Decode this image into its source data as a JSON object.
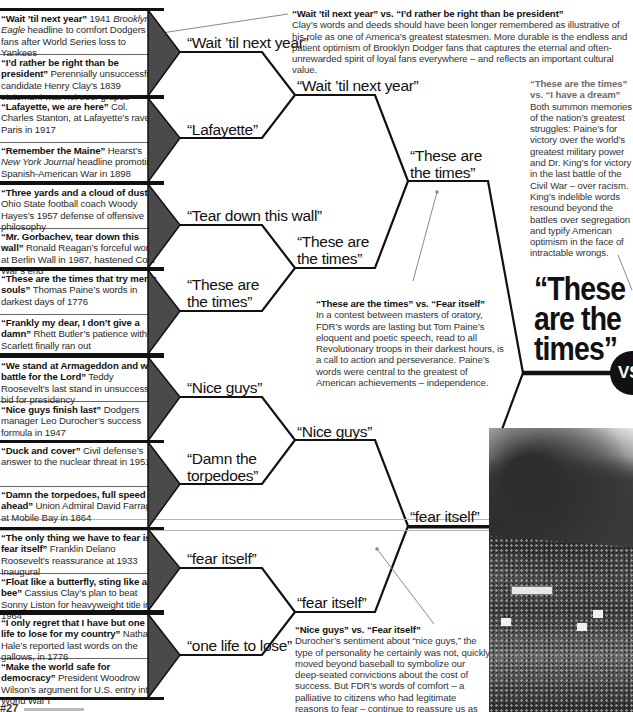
{
  "entries": [
    {
      "pair": [
        {
          "quote": "“Wait ’til next year”",
          "desc_pre": " 1941 ",
          "desc_italic": "Brooklyn Eagle",
          "desc_post": " headline to comfort Dodgers fans after World Series loss to Yankees"
        },
        {
          "quote": "“I’d rather be right than be president”",
          "desc_pre": " Perennially unsuccessful candidate Henry Clay’s 1839 statement was not sour grapes",
          "desc_italic": "",
          "desc_post": ""
        }
      ],
      "winner": "“Wait ’til next year”"
    },
    {
      "pair": [
        {
          "quote": "“Lafayette, we are here”",
          "desc_pre": " Col. Charles Stanton, at Lafayette’s rave in Paris in 1917",
          "desc_italic": "",
          "desc_post": ""
        },
        {
          "quote": "“Remember the Maine”",
          "desc_pre": " Hearst’s ",
          "desc_italic": "New York Journal",
          "desc_post": " headline promoting Spanish-American War in 1898"
        }
      ],
      "winner": "“Lafayette”"
    },
    {
      "pair": [
        {
          "quote": "“Three yards and a cloud of dust”",
          "desc_pre": " Ohio State football coach Woody Hayes’s 1957 defense of offensive philosophy",
          "desc_italic": "",
          "desc_post": ""
        },
        {
          "quote": "“Mr. Gorbachev, tear down this wall”",
          "desc_pre": " Ronald Reagan’s forceful words at Berlin Wall in 1987, hastened Cold War’s end",
          "desc_italic": "",
          "desc_post": ""
        }
      ],
      "winner": "“Tear down this wall”"
    },
    {
      "pair": [
        {
          "quote": "“These are the times that try men’s souls”",
          "desc_pre": " Thomas Paine’s words in darkest days of 1776",
          "desc_italic": "",
          "desc_post": ""
        },
        {
          "quote": "“Frankly my dear, I don’t give a damn”",
          "desc_pre": " Rhett Butler’s patience with Scarlett finally ran out",
          "desc_italic": "",
          "desc_post": ""
        }
      ],
      "winner": "“These are the times”"
    },
    {
      "pair": [
        {
          "quote": "“We stand at Armageddon and we battle for the Lord”",
          "desc_pre": " Teddy Roosevelt’s last stand in unsuccessful bid for presidency",
          "desc_italic": "",
          "desc_post": ""
        },
        {
          "quote": "“Nice guys finish last”",
          "desc_pre": " Dodgers manager Leo Durocher’s success formula in 1947",
          "desc_italic": "",
          "desc_post": ""
        }
      ],
      "winner": "“Nice guys”"
    },
    {
      "pair": [
        {
          "quote": "“Duck and cover”",
          "desc_pre": " Civil defense’s answer to the nuclear threat in 1951",
          "desc_italic": "",
          "desc_post": ""
        },
        {
          "quote": "“Damn the torpedoes, full speed ahead”",
          "desc_pre": " Union Admiral David Farragut at Mobile Bay in 1864",
          "desc_italic": "",
          "desc_post": ""
        }
      ],
      "winner": "“Damn the torpedoes”"
    },
    {
      "pair": [
        {
          "quote": "“The only thing we have to fear is fear itself”",
          "desc_pre": " Franklin Delano Roosevelt’s reassurance at 1933 Inaugural",
          "desc_italic": "",
          "desc_post": ""
        },
        {
          "quote": "“Float like a butterfly, sting like a bee”",
          "desc_pre": " Cassius Clay’s plan to beat Sonny Liston for heavyweight title in 1964",
          "desc_italic": "",
          "desc_post": ""
        }
      ],
      "winner": "“fear itself”"
    },
    {
      "pair": [
        {
          "quote": "“I only regret that I have but one life to lose for my country”",
          "desc_pre": " Nathan Hale’s reported last words on the gallows, in 1776",
          "desc_italic": "",
          "desc_post": ""
        },
        {
          "quote": "“Make the world safe for democracy”",
          "desc_pre": " President Woodrow Wilson’s argument for U.S. entry into World War I",
          "desc_italic": "",
          "desc_post": ""
        }
      ],
      "winner": "“one life to lose”"
    }
  ],
  "round2": [
    "“Wait ’til next year”",
    "“These are the times”",
    "“Nice guys”",
    "“fear itself”"
  ],
  "round3": [
    "“These are the times”",
    "“fear itself”"
  ],
  "final": {
    "winner_line1": "“These",
    "winner_line2": "are the",
    "winner_line3": "times”",
    "vs_label": "VS"
  },
  "notes": {
    "wait_vs_president": {
      "title": "“Wait ’til next year” vs. “I’d rather be right than be president”",
      "body": "Clay’s words and deeds should have been longer remembered as illustrative of his role as one of America’s greatest statesmen. More durable is the endless and patient optimism of Brooklyn Dodger fans that captures the eternal and often-unrewarded spirit of loyal fans everywhere – and reflects an important cultural value."
    },
    "times_vs_dream": {
      "title": "“These are the times” vs. “I have a dream”",
      "body": "Both summon memories of the nation’s greatest struggles: Paine’s for victory over the world’s greatest military power and Dr. King’s for victory in the last battle of the Civil War – over racism. King’s indelible words resound beyond the battles over segregation and typify American optimism in the face of intractable wrongs."
    },
    "times_vs_fear": {
      "title": "“These are the times” vs. “Fear itself”",
      "body": "In a contest between masters of oratory, FDR’s words are lasting but Tom Paine’s eloquent and poetic speech, read to all Revolutionary troops in their darkest hours, is a call to action and perseverance. Paine’s words were central to the greatest of American achievements – independence."
    },
    "nice_vs_fear": {
      "title": "“Nice guys” vs. “Fear itself”",
      "body": "Durocher’s sentiment about “nice guys,” the type of personality he certainly was not, quickly moved beyond baseball to symbolize our deep-seated convictions about the cost of success. But FDR’s words of comfort – a palliative to citizens who had legitimate reasons to fear – continue to reassure us as the country faces yet another crisis."
    }
  },
  "footer": {
    "page_tag": "#27"
  },
  "colors": {
    "line": "#111111",
    "triangle": "#4a4a4a",
    "pointer": "#8a8a8a"
  }
}
